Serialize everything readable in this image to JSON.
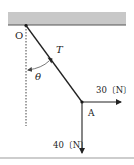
{
  "diagram": {
    "type": "physics-force-diagram",
    "labels": {
      "pivot": "O",
      "tension": "T",
      "angle": "θ",
      "point": "A",
      "horizontal_force": "30〔N〕",
      "vertical_force": "40〔N〕"
    },
    "colors": {
      "ceiling": "#c8c8c8",
      "ceiling_edge": "#555555",
      "line": "#222222",
      "bottom_rule": "#bdbdbd"
    }
  }
}
